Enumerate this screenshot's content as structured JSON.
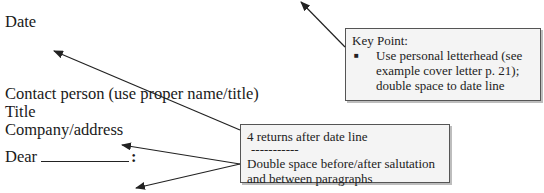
{
  "letter": {
    "date": "Date",
    "contact": "Contact person (use proper name/title)",
    "title": "Title",
    "company": "Company/address",
    "salutation": "Dear",
    "salutation_colon": ":"
  },
  "callouts": {
    "key_point": {
      "heading": "Key Point:",
      "bullet_glyph": "■",
      "bullet_text": "Use personal letterhead (see example cover letter  p. 21); double space to date line"
    },
    "returns": {
      "line1": "4 returns after date line",
      "separator": "-----------",
      "line2": "Double space before/after salutation and between paragraphs"
    }
  },
  "colors": {
    "box_fill": "#f4f4f4",
    "box_border": "#555555",
    "arrow": "#222222"
  }
}
